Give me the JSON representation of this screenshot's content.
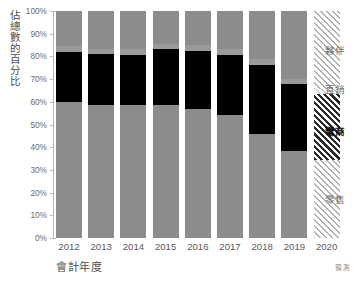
{
  "chart_data": {
    "type": "bar",
    "stacked": true,
    "stack_mode": "percent",
    "title": "",
    "xlabel": "會計年度",
    "ylabel": "佔總數的百分比",
    "categories": [
      "2012",
      "2013",
      "2014",
      "2015",
      "2016",
      "2017",
      "2018",
      "2019",
      "2020"
    ],
    "ylim": [
      0,
      100
    ],
    "yticks": [
      0,
      10,
      20,
      30,
      40,
      50,
      60,
      70,
      80,
      90,
      100
    ],
    "ytick_labels": [
      "0%",
      "10%",
      "20%",
      "30%",
      "40%",
      "50%",
      "60%",
      "70%",
      "80%",
      "90%",
      "100%"
    ],
    "grid": false,
    "legend_position": "right",
    "forecast_category": "2020",
    "footnote": "預測",
    "series": [
      {
        "name": "零售",
        "color": "#8c8c8c",
        "values": [
          60.0,
          58.5,
          58.5,
          58.5,
          56.8,
          54.4,
          46.0,
          38.2,
          34.5
        ]
      },
      {
        "name": "電商",
        "color": "#000000",
        "emphasis": true,
        "values": [
          21.8,
          22.5,
          22.3,
          24.6,
          25.8,
          26.4,
          30.2,
          29.6,
          29.0
        ]
      },
      {
        "name": "直銷",
        "color": "#9a9a9a",
        "values": [
          2.6,
          2.3,
          2.4,
          2.2,
          2.3,
          2.4,
          2.6,
          2.4,
          2.2
        ]
      },
      {
        "name": "夥伴",
        "color": "#8c8c8c",
        "values": [
          15.6,
          16.7,
          16.8,
          14.7,
          15.1,
          16.8,
          21.2,
          29.8,
          34.3
        ]
      }
    ]
  },
  "legend": {
    "items": [
      {
        "label": "夥伴",
        "bold": false
      },
      {
        "label": "直銷",
        "bold": false
      },
      {
        "label": "電商",
        "bold": true
      },
      {
        "label": "零售",
        "bold": false
      }
    ]
  }
}
